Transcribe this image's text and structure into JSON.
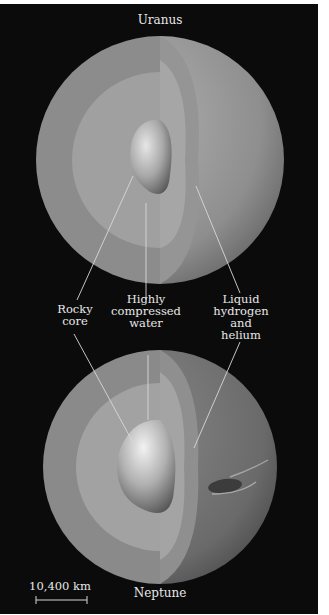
{
  "figure": {
    "top_planet": {
      "name": "Uranus"
    },
    "bottom_planet": {
      "name": "Neptune"
    },
    "labels": {
      "rocky_core": "Rocky\ncore",
      "water": "Highly\ncompressed\nwater",
      "hydrogen": "Liquid\nhydrogen\nand\nhelium"
    },
    "scale_bar": {
      "label": "10,400 km"
    },
    "colors": {
      "background": "#0b0b0b",
      "outer_layer": "#8a8a8a",
      "middle_layer": "#a3a3a3",
      "core": "#c8c8c8",
      "label_text": "#e8e8e8",
      "leader_line": "#d8d8d8"
    }
  }
}
